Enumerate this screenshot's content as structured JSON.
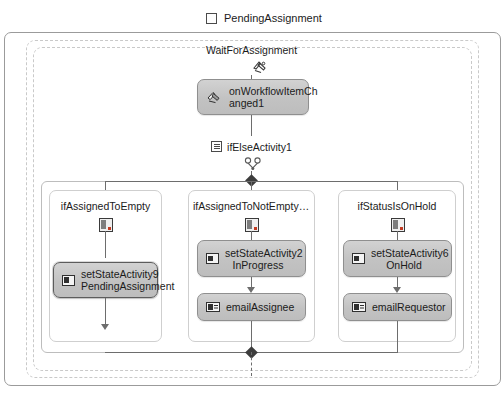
{
  "header": {
    "title": "PendingAssignment",
    "icon": "state-icon"
  },
  "state": {
    "event_driven": {
      "label": "WaitForAssignment",
      "icon": "event-driven-icon"
    },
    "handler": {
      "label_line1": "onWorkflowItemCh",
      "label_line2": "anged1",
      "icon": "event-handler-icon",
      "selected": false
    },
    "ifelse": {
      "label": "ifElseActivity1",
      "icon": "ifelse-icon",
      "decision_icon": "decision-icon",
      "branches": [
        {
          "title": "ifAssignedToEmpty",
          "icon": "condition-icon",
          "activities": [
            {
              "name": "setStateActivity9",
              "state": "PendingAssignment",
              "icon": "set-state-icon",
              "selected": true
            }
          ]
        },
        {
          "title": "ifAssignedToNotEmptyAn...",
          "icon": "condition-icon",
          "activities": [
            {
              "name": "setStateActivity2",
              "state": "InProgress",
              "icon": "set-state-icon",
              "selected": false
            },
            {
              "name": "emailAssignee",
              "state": "",
              "icon": "email-icon",
              "selected": false
            }
          ]
        },
        {
          "title": "ifStatusIsOnHold",
          "icon": "condition-icon",
          "activities": [
            {
              "name": "setStateActivity6",
              "state": "OnHold",
              "icon": "set-state-icon",
              "selected": false
            },
            {
              "name": "emailRequestor",
              "state": "",
              "icon": "email-icon",
              "selected": false
            }
          ]
        }
      ]
    }
  },
  "colors": {
    "activity_fill": "#c6c6c6",
    "activity_border": "#8f8f8f",
    "connector": "#6d6d6d",
    "frame_border": "#9b9b9b",
    "dashed_border": "#c9c9c9",
    "selection_border": "#5c5c5c"
  }
}
